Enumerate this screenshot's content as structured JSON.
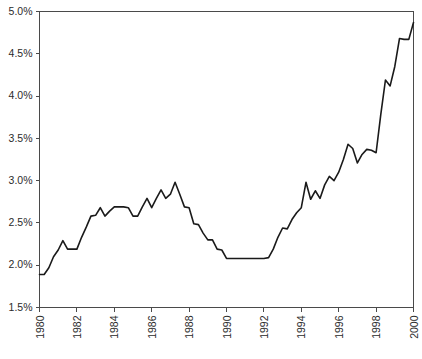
{
  "chart_data": {
    "type": "line",
    "title": "",
    "subtitle": "",
    "xlabel": "",
    "ylabel": "",
    "xlim": [
      1980,
      2000
    ],
    "ylim": [
      1.5,
      5.0
    ],
    "ytick_values": [
      1.5,
      2.0,
      2.5,
      3.0,
      3.5,
      4.0,
      4.5,
      5.0
    ],
    "ytick_labels": [
      "1.5%",
      "2.0%",
      "2.5%",
      "3.0%",
      "3.5%",
      "4.0%",
      "4.5%",
      "5.0%"
    ],
    "xtick_values": [
      1980,
      1982,
      1984,
      1986,
      1988,
      1990,
      1992,
      1994,
      1996,
      1998,
      2000
    ],
    "xtick_labels": [
      "1980",
      "1982",
      "1984",
      "1986",
      "1988",
      "1990",
      "1992",
      "1994",
      "1996",
      "1998",
      "2000"
    ],
    "xtick_rotation": -90,
    "grid": false,
    "legend": null,
    "legend_position": "none",
    "series": [
      {
        "name": "series-1",
        "color": "#1a1a1a",
        "x": [
          1980.0,
          1980.25,
          1980.5,
          1980.75,
          1981.0,
          1981.25,
          1981.5,
          1981.75,
          1982.0,
          1982.25,
          1982.5,
          1982.75,
          1983.0,
          1983.25,
          1983.5,
          1983.75,
          1984.0,
          1984.25,
          1984.5,
          1984.75,
          1985.0,
          1985.25,
          1985.5,
          1985.75,
          1986.0,
          1986.25,
          1986.5,
          1986.75,
          1987.0,
          1987.25,
          1987.5,
          1987.75,
          1988.0,
          1988.25,
          1988.5,
          1988.75,
          1989.0,
          1989.25,
          1989.5,
          1989.75,
          1990.0,
          1990.25,
          1990.5,
          1990.75,
          1991.0,
          1991.25,
          1991.5,
          1991.75,
          1992.0,
          1992.25,
          1992.5,
          1992.75,
          1993.0,
          1993.25,
          1993.5,
          1993.75,
          1994.0,
          1994.25,
          1994.5,
          1994.75,
          1995.0,
          1995.25,
          1995.5,
          1995.75,
          1996.0,
          1996.25,
          1996.5,
          1996.75,
          1997.0,
          1997.25,
          1997.5,
          1997.75,
          1998.0,
          1998.25,
          1998.5,
          1998.75,
          1999.0,
          1999.25,
          1999.5,
          1999.75,
          2000.0
        ],
        "values": [
          1.89,
          1.89,
          1.97,
          2.1,
          2.18,
          2.29,
          2.19,
          2.19,
          2.19,
          2.33,
          2.45,
          2.58,
          2.59,
          2.68,
          2.58,
          2.64,
          2.69,
          2.69,
          2.69,
          2.68,
          2.58,
          2.58,
          2.69,
          2.79,
          2.68,
          2.79,
          2.89,
          2.79,
          2.84,
          2.98,
          2.84,
          2.69,
          2.68,
          2.49,
          2.48,
          2.38,
          2.3,
          2.3,
          2.19,
          2.18,
          2.08,
          2.08,
          2.08,
          2.08,
          2.08,
          2.08,
          2.08,
          2.08,
          2.08,
          2.09,
          2.19,
          2.33,
          2.44,
          2.43,
          2.54,
          2.62,
          2.68,
          2.98,
          2.78,
          2.88,
          2.79,
          2.95,
          3.05,
          3.0,
          3.1,
          3.25,
          3.43,
          3.38,
          3.21,
          3.31,
          3.37,
          3.36,
          3.33,
          3.78,
          4.19,
          4.12,
          4.35,
          4.68,
          4.67,
          4.67,
          4.87
        ]
      }
    ]
  },
  "axes": {
    "top_spine": true,
    "right_spine": true,
    "left_spine": true,
    "bottom_spine": true,
    "spine_color": "#4a4a4a"
  }
}
